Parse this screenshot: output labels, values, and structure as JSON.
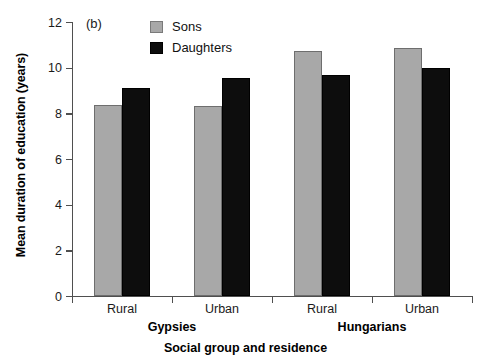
{
  "chart_data": {
    "type": "bar",
    "title": "",
    "panel_label": "(b)",
    "xlabel": "Social group and residence",
    "ylabel": "Mean duration of education (years)",
    "ylim": [
      0,
      12
    ],
    "yticks": [
      0,
      2,
      4,
      6,
      8,
      10,
      12
    ],
    "grid": false,
    "legend_position": "top-center",
    "categories": [
      "Rural",
      "Urban",
      "Rural",
      "Urban"
    ],
    "groups": [
      {
        "name": "Gypsies",
        "categories": [
          "Rural",
          "Urban"
        ]
      },
      {
        "name": "Hungarians",
        "categories": [
          "Rural",
          "Urban"
        ]
      }
    ],
    "series": [
      {
        "name": "Sons",
        "color": "#a8a8a8",
        "values": [
          8.35,
          8.3,
          10.75,
          10.85
        ]
      },
      {
        "name": "Daughters",
        "color": "#0d0d0d",
        "values": [
          9.1,
          9.55,
          9.7,
          10.0
        ]
      }
    ]
  },
  "axes": {
    "y_title": "Mean duration of education (years)",
    "x_title": "Social group and residence",
    "y_tick_labels": [
      "12",
      "10",
      "8",
      "6",
      "4",
      "2",
      "0"
    ]
  },
  "legend": {
    "items": [
      {
        "label": "Sons",
        "swatch": "sons-swatch"
      },
      {
        "label": "Daughters",
        "swatch": "daughters-swatch"
      }
    ]
  },
  "panel": {
    "label": "(b)"
  },
  "category_labels": [
    "Rural",
    "Urban",
    "Rural",
    "Urban"
  ],
  "group_labels": [
    "Gypsies",
    "Hungarians"
  ]
}
